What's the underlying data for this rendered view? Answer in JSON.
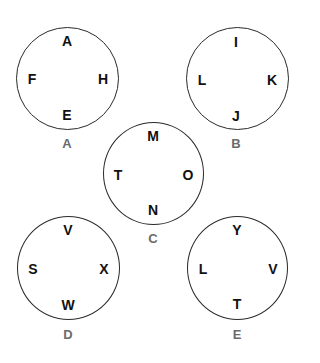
{
  "puzzle": {
    "circles": [
      {
        "id": "A",
        "label": "A",
        "top": "A",
        "left": "F",
        "right": "H",
        "bottom": "E"
      },
      {
        "id": "B",
        "label": "B",
        "top": "I",
        "left": "L",
        "right": "K",
        "bottom": "J"
      },
      {
        "id": "C",
        "label": "C",
        "top": "M",
        "left": "T",
        "right": "O",
        "bottom": "N"
      },
      {
        "id": "D",
        "label": "D",
        "top": "V",
        "left": "S",
        "right": "X",
        "bottom": "W"
      },
      {
        "id": "E",
        "label": "E",
        "top": "Y",
        "left": "L",
        "right": "V",
        "bottom": "T"
      }
    ]
  },
  "colors": {
    "circle_stroke": "#2a2a2a",
    "letter": "#111111",
    "label": "#6b6b6b",
    "background": "#ffffff"
  }
}
